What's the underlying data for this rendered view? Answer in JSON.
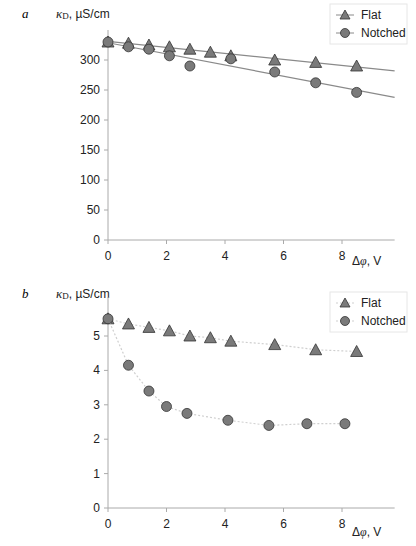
{
  "chart_data": [
    {
      "panel": "a",
      "type": "scatter",
      "ylabel": "κD , µS/cm",
      "xlabel": "Δφ, V",
      "xlim": [
        0,
        9.8
      ],
      "ylim": [
        0,
        350
      ],
      "xticks": [
        0,
        2,
        4,
        6,
        8
      ],
      "yticks": [
        0,
        50,
        100,
        150,
        200,
        250,
        300
      ],
      "grid": false,
      "legend_position": "top-right",
      "series": [
        {
          "name": "Flat",
          "marker": "triangle",
          "line": "solid",
          "x": [
            0,
            0.7,
            1.4,
            2.1,
            2.8,
            3.5,
            4.2,
            5.7,
            7.1,
            8.5
          ],
          "y": [
            330,
            328,
            325,
            322,
            318,
            313,
            307,
            300,
            296,
            290
          ]
        },
        {
          "name": "Notched",
          "marker": "circle",
          "line": "solid",
          "x": [
            0,
            0.7,
            1.4,
            2.1,
            2.8,
            4.2,
            5.7,
            7.1,
            8.5
          ],
          "y": [
            330,
            322,
            318,
            307,
            290,
            302,
            280,
            262,
            246
          ]
        }
      ]
    },
    {
      "panel": "b",
      "type": "scatter",
      "ylabel": "κD , µS/cm",
      "xlabel": "Δφ, V",
      "xlim": [
        0,
        9.8
      ],
      "ylim": [
        0,
        6
      ],
      "xticks": [
        0,
        2,
        4,
        6,
        8
      ],
      "yticks": [
        0,
        1,
        2,
        3,
        4,
        5
      ],
      "grid": false,
      "legend_position": "top-right",
      "series": [
        {
          "name": "Flat",
          "marker": "triangle",
          "line": "dotted",
          "x": [
            0,
            0.7,
            1.4,
            2.1,
            2.8,
            3.5,
            4.2,
            5.7,
            7.1,
            8.5
          ],
          "y": [
            5.5,
            5.35,
            5.25,
            5.15,
            5.0,
            4.95,
            4.85,
            4.75,
            4.6,
            4.55
          ]
        },
        {
          "name": "Notched",
          "marker": "circle",
          "line": "dotted",
          "x": [
            0,
            0.7,
            1.4,
            2.0,
            2.7,
            4.1,
            5.5,
            6.8,
            8.1
          ],
          "y": [
            5.5,
            4.15,
            3.4,
            2.95,
            2.75,
            2.55,
            2.4,
            2.45,
            2.45
          ]
        }
      ]
    }
  ],
  "panels": [
    {
      "label": "a",
      "ylabel_kappa": "κ",
      "ylabel_sub": "D",
      "ylabel_unit": ", µS/cm",
      "xlabel": "Δφ, V",
      "legend": [
        "Flat",
        "Notched"
      ]
    },
    {
      "label": "b",
      "ylabel_kappa": "κ",
      "ylabel_sub": "D",
      "ylabel_unit": ", µS/cm",
      "xlabel": "Δφ, V",
      "legend": [
        "Flat",
        "Notched"
      ]
    }
  ]
}
